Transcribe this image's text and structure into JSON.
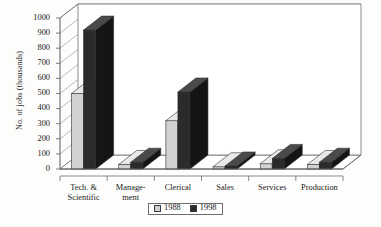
{
  "chart_data": {
    "type": "bar",
    "title": "",
    "subtitle": "",
    "xlabel": "",
    "ylabel": "No. of jobs (thousands)",
    "ylim": [
      0,
      1000
    ],
    "ytick_step": 100,
    "yticks": [
      "0",
      "100",
      "200",
      "300",
      "400",
      "500",
      "600",
      "700",
      "800",
      "900",
      "1000"
    ],
    "grid": true,
    "style": "3d-grouped-columns",
    "legend_position": "bottom-center",
    "categories": [
      "Tech. &\nScientific",
      "Manage-\nment",
      "Clerical",
      "Sales",
      "Services",
      "Production"
    ],
    "series": [
      {
        "name": "1988",
        "color": "#d2d2d2",
        "values": [
          500,
          30,
          320,
          15,
          35,
          30
        ]
      },
      {
        "name": "1998",
        "color": "#2b2b2b",
        "values": [
          920,
          45,
          510,
          20,
          70,
          45
        ]
      }
    ]
  },
  "legend": {
    "entries": [
      {
        "label": "1988"
      },
      {
        "label": "1998"
      }
    ]
  },
  "colors": {
    "series_1988": "#d2d2d2",
    "series_1998": "#2b2b2b",
    "axis": "#5a5a5a",
    "gridline": "#8c8c8c",
    "background": "#fdfdfc",
    "text": "#1a1a1a"
  }
}
